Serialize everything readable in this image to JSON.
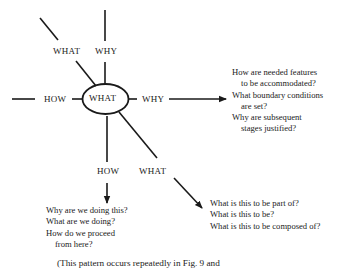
{
  "center_node": {
    "label": "WHAT"
  },
  "branches": {
    "up_left": {
      "label": "WHAT"
    },
    "up": {
      "label": "WHY"
    },
    "left": {
      "label": "HOW"
    },
    "right": {
      "label": "WHY"
    },
    "down": {
      "label": "HOW"
    },
    "down_right": {
      "label": "WHAT"
    }
  },
  "question_blocks": {
    "why": {
      "lines": [
        "How are needed features",
        "to be accommodated?",
        "What boundary conditions",
        "are set?",
        "Why are subsequent",
        "stages justified?"
      ]
    },
    "how": {
      "lines": [
        "Why are we doing this?",
        "What are we doing?",
        "How do we proceed",
        "from here?"
      ]
    },
    "what": {
      "lines": [
        "What is this to be part of?",
        "What is this to be?",
        "What is this to be composed of?"
      ]
    }
  },
  "caption": "(This pattern occurs repeatedly in Fig. 9 and",
  "colors": {
    "ink": "#1a1a1a",
    "background": "#ffffff"
  }
}
